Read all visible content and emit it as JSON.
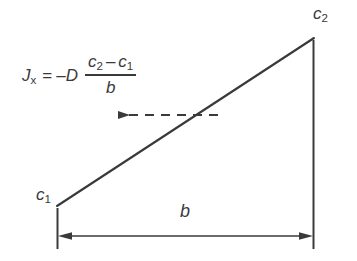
{
  "figure": {
    "background_color": "#ffffff",
    "line_color": "#3a3a3a"
  },
  "equation": {
    "flux_symbol": "J",
    "flux_subscript": "x",
    "equals": "=",
    "coefficient": "–D",
    "numerator_left": "c",
    "numerator_left_sub": "2",
    "numerator_operator": "–",
    "numerator_right": "c",
    "numerator_right_sub": "1",
    "denominator": "b",
    "full_text": "Jx = –D (c2 – c1)/b"
  },
  "labels": {
    "c1": {
      "symbol": "c",
      "subscript": "1"
    },
    "c2": {
      "symbol": "c",
      "subscript": "2"
    },
    "width": {
      "symbol": "b"
    }
  },
  "annotations": {
    "flux_arrow": {
      "name": "dashed-flux-arrow",
      "direction": "left",
      "style": "dashed",
      "x_start": 218,
      "x_end": 112,
      "y": 115
    },
    "dimension_arrow": {
      "name": "width-dimension-arrow",
      "direction": "both",
      "style": "solid",
      "x_start": 58,
      "x_end": 313,
      "y": 236
    }
  },
  "geometry": {
    "concentration_line": {
      "x1": 57,
      "y1": 206,
      "x2": 314,
      "y2": 38
    },
    "left_tick": {
      "x": 57,
      "y1": 208,
      "y2": 249
    },
    "right_tick": {
      "x": 314,
      "y1": 40,
      "y2": 249
    }
  }
}
